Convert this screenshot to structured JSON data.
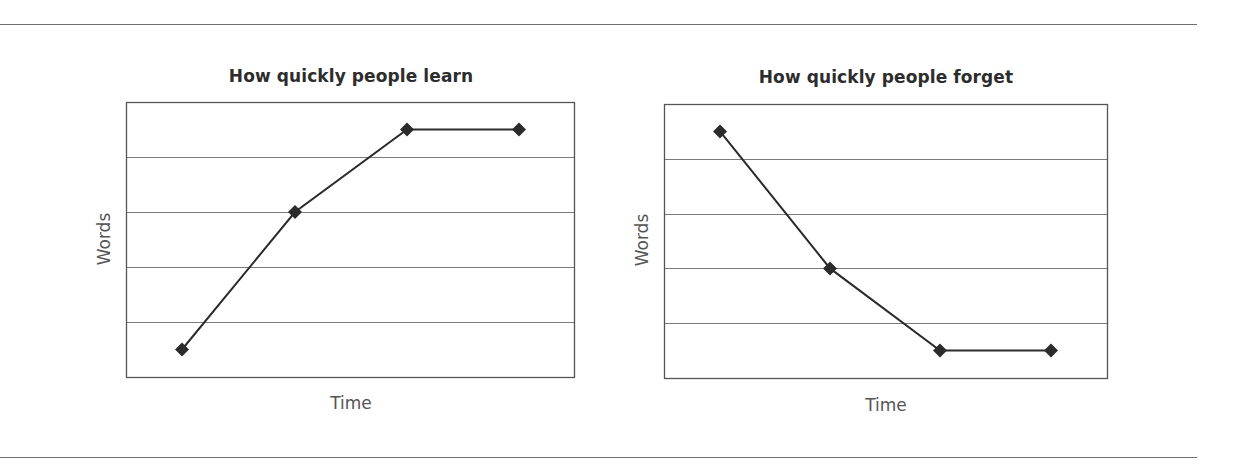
{
  "chart_data": [
    {
      "type": "line",
      "title": "How quickly people learn",
      "xlabel": "Time",
      "ylabel": "Words",
      "x": [
        1,
        2,
        3,
        4
      ],
      "series": [
        {
          "name": "Words learned",
          "values": [
            0.5,
            3,
            4.5,
            4.5
          ],
          "marker": "diamond",
          "color": "#2b2b2b"
        }
      ],
      "ylim": [
        0,
        5
      ],
      "y_gridlines": [
        1,
        2,
        3,
        4
      ],
      "grid": true,
      "tick_labels_shown": false,
      "legend": "none"
    },
    {
      "type": "line",
      "title": "How quickly people forget",
      "xlabel": "Time",
      "ylabel": "Words",
      "x": [
        1,
        2,
        3,
        4
      ],
      "series": [
        {
          "name": "Words remembered",
          "values": [
            4.5,
            2,
            0.5,
            0.5
          ],
          "marker": "diamond",
          "color": "#2b2b2b"
        }
      ],
      "ylim": [
        0,
        5
      ],
      "y_gridlines": [
        1,
        2,
        3,
        4
      ],
      "grid": true,
      "tick_labels_shown": false,
      "legend": "none"
    }
  ],
  "charts": [
    {
      "title": "How quickly people learn",
      "xlabel": "Time",
      "ylabel": "Words"
    },
    {
      "title": "How quickly people forget",
      "xlabel": "Time",
      "ylabel": "Words"
    }
  ],
  "colors": {
    "line": "#2b2b2b",
    "frame": "#555555",
    "grid": "#7a7a7a",
    "rule": "#6e6e6e"
  }
}
